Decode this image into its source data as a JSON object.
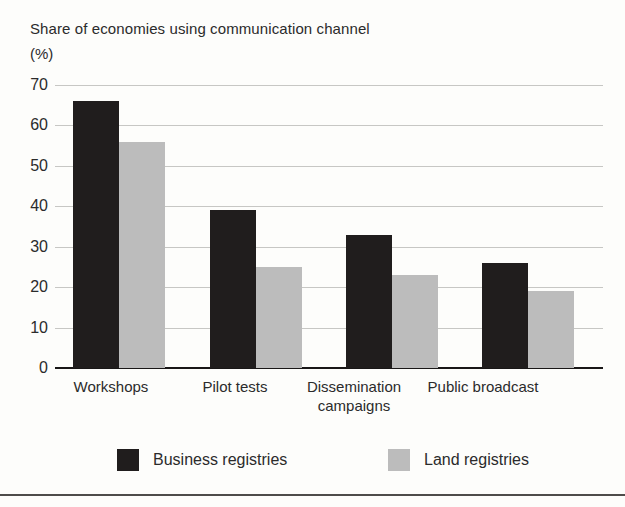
{
  "title": {
    "line1": "Share of economies using communication channel",
    "line2": "(%)"
  },
  "chart_data": {
    "type": "bar",
    "title": "Share of economies using communication channel (%)",
    "categories": [
      "Workshops",
      "Pilot tests",
      "Dissemination\ncampaigns",
      "Public broadcast"
    ],
    "series": [
      {
        "name": "Business registries",
        "values": [
          66,
          39,
          33,
          26
        ]
      },
      {
        "name": "Land registries",
        "values": [
          56,
          25,
          23,
          19
        ]
      }
    ],
    "xlabel": "",
    "ylabel": "(%)",
    "ylim": [
      0,
      70
    ],
    "yticks": [
      0,
      10,
      20,
      30,
      40,
      50,
      60,
      70
    ],
    "grid": true,
    "legend_position": "bottom"
  },
  "legend": [
    {
      "label": "Business registries",
      "color": "#201d1d"
    },
    {
      "label": "Land registries",
      "color": "#bcbcbc"
    }
  ],
  "colors": {
    "background": "#fdfdfb",
    "gridline": "#c7c7c4",
    "axis": "#191717",
    "text": "#2b2b2b",
    "business_bar": "#201d1d",
    "land_bar": "#bcbcbc"
  }
}
